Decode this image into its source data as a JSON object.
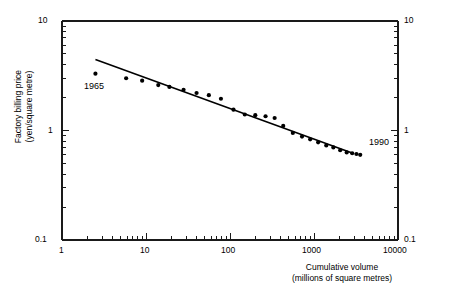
{
  "chart_data": {
    "type": "scatter",
    "title": "",
    "xlabel": "Cumulative volume\n(millions of square metres)",
    "ylabel": "Factory billing price\n(yen/square metre)",
    "xscale": "log",
    "yscale": "log",
    "xlim": [
      1,
      10000
    ],
    "ylim": [
      0.1,
      10
    ],
    "grid": false,
    "legend": null,
    "x_ticks": [
      "1",
      "10",
      "100",
      "1000",
      "10000"
    ],
    "y_ticks": [
      "0.1",
      "1",
      "10"
    ],
    "y_ticks_right": [
      "0.1",
      "1",
      "10"
    ],
    "x_tick_values": [
      1,
      10,
      100,
      1000,
      10000
    ],
    "y_tick_values": [
      0.1,
      1,
      10
    ],
    "series": [
      {
        "name": "Factory billing price vs cumulative volume",
        "marker": "filled-circle",
        "x": [
          2.5,
          5.8,
          9.0,
          14.0,
          19.0,
          28.0,
          40.0,
          56.0,
          78.0,
          110.0,
          150.0,
          200.0,
          265.0,
          340.0,
          430.0,
          560.0,
          720.0,
          900.0,
          1120.0,
          1400.0,
          1700.0,
          2050.0,
          2450.0,
          2850.0,
          3200.0,
          3550.0
        ],
        "y": [
          3.3,
          3.0,
          2.85,
          2.6,
          2.5,
          2.35,
          2.2,
          2.1,
          1.95,
          1.55,
          1.4,
          1.38,
          1.35,
          1.3,
          1.1,
          0.95,
          0.88,
          0.83,
          0.78,
          0.73,
          0.7,
          0.66,
          0.63,
          0.62,
          0.61,
          0.6
        ]
      }
    ],
    "trendline": {
      "name": "fitted experience curve",
      "x_start": 2.5,
      "y_start": 4.45,
      "x_end": 2900,
      "y_end": 0.62,
      "style": "solid"
    },
    "annotations": [
      {
        "text": "1965",
        "x": 2.5,
        "y": 2.35,
        "name": "annotation-1965"
      },
      {
        "text": "1990",
        "x": 3200,
        "y": 0.95,
        "name": "annotation-1990"
      }
    ]
  },
  "axes": {
    "left_labels": [
      "10",
      "1",
      "0.1"
    ],
    "right_labels": [
      "10",
      "1",
      "0.1"
    ],
    "bottom_labels": [
      "1",
      "10",
      "100",
      "1000",
      "10000"
    ],
    "ylabel_line1": "Factory billing price",
    "ylabel_line2": "(yen/square metre)",
    "xlabel_line1": "Cumulative volume",
    "xlabel_line2": "(millions of square metres)"
  },
  "style": {
    "axis_color": "#1a1a1a",
    "point_color": "#000000",
    "line_color": "#000000",
    "background": "#ffffff"
  }
}
